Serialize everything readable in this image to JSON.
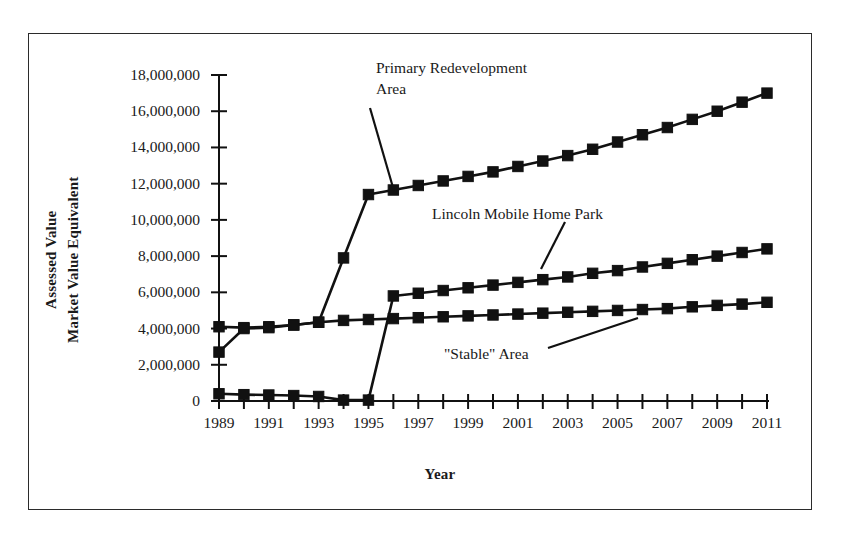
{
  "chart_data": {
    "type": "line",
    "title": "",
    "xlabel": "Year",
    "ylabel": "Assessed Value\nMarket Value Equivalent",
    "ylabel_line1": "Assessed Value",
    "ylabel_line2": "Market Value Equivalent",
    "x": [
      1989,
      1990,
      1991,
      1992,
      1993,
      1994,
      1995,
      1996,
      1997,
      1998,
      1999,
      2000,
      2001,
      2002,
      2003,
      2004,
      2005,
      2006,
      2007,
      2008,
      2009,
      2010,
      2011
    ],
    "xlim": [
      1989,
      2011
    ],
    "ylim": [
      0,
      18000000
    ],
    "grid": false,
    "legend_position": "none",
    "ytick_labels": [
      "0",
      "2,000,000",
      "4,000,000",
      "6,000,000",
      "8,000,000",
      "10,000,000",
      "12,000,000",
      "14,000,000",
      "16,000,000",
      "18,000,000"
    ],
    "ytick_values": [
      0,
      2000000,
      4000000,
      6000000,
      8000000,
      10000000,
      12000000,
      14000000,
      16000000,
      18000000
    ],
    "xtick_values": [
      1989,
      1990,
      1991,
      1992,
      1993,
      1994,
      1995,
      1996,
      1997,
      1998,
      1999,
      2000,
      2001,
      2002,
      2003,
      2004,
      2005,
      2006,
      2007,
      2008,
      2009,
      2010,
      2011
    ],
    "xtick_labels_shown": [
      "1989",
      "1991",
      "1993",
      "1995",
      "1997",
      "1999",
      "2001",
      "2003",
      "2005",
      "2007",
      "2009",
      "2011"
    ],
    "series": [
      {
        "name": "Primary Redevelopment Area",
        "color": "#111111",
        "marker": "square",
        "x": [
          1989,
          1990,
          1991,
          1992,
          1993,
          1994,
          1995,
          1996,
          1997,
          1998,
          1999,
          2000,
          2001,
          2002,
          2003,
          2004,
          2005,
          2006,
          2007,
          2008,
          2009,
          2010,
          2011
        ],
        "values": [
          2700000,
          4000000,
          4050000,
          4200000,
          4350000,
          7900000,
          11400000,
          11650000,
          11900000,
          12150000,
          12400000,
          12650000,
          12950000,
          13250000,
          13550000,
          13900000,
          14300000,
          14700000,
          15100000,
          15550000,
          16000000,
          16500000,
          17000000
        ]
      },
      {
        "name": "Lincoln Mobile Home Park",
        "color": "#111111",
        "marker": "square",
        "x": [
          1989,
          1990,
          1991,
          1992,
          1993,
          1994,
          1995,
          1996,
          1997,
          1998,
          1999,
          2000,
          2001,
          2002,
          2003,
          2004,
          2005,
          2006,
          2007,
          2008,
          2009,
          2010,
          2011
        ],
        "values": [
          400000,
          350000,
          330000,
          300000,
          250000,
          50000,
          50000,
          5800000,
          5950000,
          6100000,
          6250000,
          6400000,
          6550000,
          6700000,
          6850000,
          7050000,
          7200000,
          7400000,
          7600000,
          7800000,
          8000000,
          8200000,
          8400000
        ]
      },
      {
        "name": "\"Stable\" Area",
        "color": "#111111",
        "marker": "square",
        "x": [
          1989,
          1990,
          1991,
          1992,
          1993,
          1994,
          1995,
          1996,
          1997,
          1998,
          1999,
          2000,
          2001,
          2002,
          2003,
          2004,
          2005,
          2006,
          2007,
          2008,
          2009,
          2010,
          2011
        ],
        "values": [
          4100000,
          4050000,
          4100000,
          4200000,
          4350000,
          4450000,
          4500000,
          4550000,
          4600000,
          4650000,
          4700000,
          4750000,
          4800000,
          4850000,
          4900000,
          4950000,
          5000000,
          5050000,
          5100000,
          5200000,
          5280000,
          5350000,
          5450000
        ]
      }
    ],
    "annotations": [
      {
        "id": "primary",
        "text_line1": "Primary Redevelopment",
        "text_line2": "Area",
        "x": 376,
        "y": 58,
        "leader_from": [
          370,
          108
        ],
        "leader_to": [
          394,
          191
        ]
      },
      {
        "id": "lincoln",
        "text": "Lincoln Mobile Home Park",
        "x": 432,
        "y": 204,
        "leader_from": [
          565,
          222
        ],
        "leader_to": [
          541,
          269
        ]
      },
      {
        "id": "stable",
        "text": "\"Stable\" Area",
        "x": 444,
        "y": 344,
        "leader_from": [
          548,
          348
        ],
        "leader_to": [
          638,
          318
        ]
      }
    ]
  }
}
